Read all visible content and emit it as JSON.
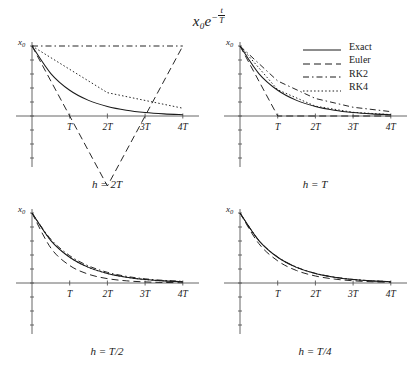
{
  "title": {
    "base": "x",
    "sub": "0",
    "exp_base": "e",
    "exp_num": "t",
    "exp_den": "T",
    "full": "x0 e^(-t/T)"
  },
  "legend": {
    "position": "top-right",
    "entries": [
      {
        "label": "Exact",
        "style": "solid",
        "dash": "none",
        "color": "#1a1a1a"
      },
      {
        "label": "Euler",
        "style": "dashed",
        "dash": "7,4",
        "color": "#1a1a1a"
      },
      {
        "label": "RK2",
        "style": "dashdot",
        "dash": "6,3,1.5,3",
        "color": "#1a1a1a"
      },
      {
        "label": "RK4",
        "style": "dotted",
        "dash": "1.5,2.2",
        "color": "#1a1a1a"
      }
    ]
  },
  "axes": {
    "xlabel": "",
    "ylabel": "x0",
    "ytop_label": "x",
    "ytop_sub": "0",
    "xticks": [
      {
        "t": 1,
        "label": "T"
      },
      {
        "t": 2,
        "label": "2T"
      },
      {
        "t": 3,
        "label": "3T"
      },
      {
        "t": 4,
        "label": "4T"
      }
    ],
    "xlim": [
      0,
      4.35
    ],
    "grid": false
  },
  "chart_data": {
    "type": "line",
    "xlabel": "t",
    "ylabel": "x",
    "x": [
      0,
      1,
      2,
      3,
      4
    ],
    "xlim": [
      0,
      4.35
    ],
    "ylim": [
      -1.15,
      1.05
    ],
    "legend": [
      "Exact",
      "Euler",
      "RK2",
      "RK4"
    ],
    "panels": [
      {
        "caption": "h = 2T",
        "h": 2,
        "ylim": [
          -1.15,
          1.05
        ],
        "series": [
          {
            "name": "Exact",
            "x": [
              0,
              0.5,
              1,
              1.5,
              2,
              2.5,
              3,
              3.5,
              4
            ],
            "values": [
              1,
              0.6065,
              0.3679,
              0.2231,
              0.1353,
              0.0821,
              0.0498,
              0.0302,
              0.0183
            ]
          },
          {
            "name": "Euler",
            "x": [
              0,
              2,
              4
            ],
            "values": [
              1,
              -1,
              1
            ]
          },
          {
            "name": "RK2",
            "x": [
              0,
              2,
              4
            ],
            "values": [
              1,
              1,
              1
            ]
          },
          {
            "name": "RK4",
            "x": [
              0,
              2,
              4
            ],
            "values": [
              1,
              0.3333,
              0.1111
            ]
          }
        ]
      },
      {
        "caption": "h = T",
        "h": 1,
        "ylim": [
          -1.15,
          1.05
        ],
        "series": [
          {
            "name": "Exact",
            "x": [
              0,
              0.5,
              1,
              1.5,
              2,
              2.5,
              3,
              3.5,
              4
            ],
            "values": [
              1,
              0.6065,
              0.3679,
              0.2231,
              0.1353,
              0.0821,
              0.0498,
              0.0302,
              0.0183
            ]
          },
          {
            "name": "Euler",
            "x": [
              0,
              1,
              2,
              3,
              4
            ],
            "values": [
              1,
              0,
              0,
              0,
              0
            ]
          },
          {
            "name": "RK2",
            "x": [
              0,
              1,
              2,
              3,
              4
            ],
            "values": [
              1,
              0.5,
              0.25,
              0.125,
              0.0625
            ]
          },
          {
            "name": "RK4",
            "x": [
              0,
              1,
              2,
              3,
              4
            ],
            "values": [
              1,
              0.375,
              0.1406,
              0.0527,
              0.0198
            ]
          }
        ]
      },
      {
        "caption": "h = T/2",
        "h": 0.5,
        "ylim": [
          -1.15,
          1.05
        ],
        "series": [
          {
            "name": "Exact",
            "x": [
              0,
              0.5,
              1,
              1.5,
              2,
              2.5,
              3,
              3.5,
              4
            ],
            "values": [
              1,
              0.6065,
              0.3679,
              0.2231,
              0.1353,
              0.0821,
              0.0498,
              0.0302,
              0.0183
            ]
          },
          {
            "name": "Euler",
            "x": [
              0,
              0.5,
              1,
              1.5,
              2,
              2.5,
              3,
              3.5,
              4
            ],
            "values": [
              1,
              0.5,
              0.25,
              0.125,
              0.0625,
              0.0313,
              0.0156,
              0.0078,
              0.0039
            ]
          },
          {
            "name": "RK2",
            "x": [
              0,
              0.5,
              1,
              1.5,
              2,
              2.5,
              3,
              3.5,
              4
            ],
            "values": [
              1,
              0.625,
              0.3906,
              0.2441,
              0.1526,
              0.0954,
              0.0596,
              0.0373,
              0.0233
            ]
          },
          {
            "name": "RK4",
            "x": [
              0,
              0.5,
              1,
              1.5,
              2,
              2.5,
              3,
              3.5,
              4
            ],
            "values": [
              1,
              0.6068,
              0.3682,
              0.2234,
              0.1356,
              0.0823,
              0.0499,
              0.0303,
              0.0184
            ]
          }
        ]
      },
      {
        "caption": "h = T/4",
        "h": 0.25,
        "ylim": [
          -1.15,
          1.05
        ],
        "series": [
          {
            "name": "Exact",
            "x": [
              0,
              0.5,
              1,
              1.5,
              2,
              2.5,
              3,
              3.5,
              4
            ],
            "values": [
              1,
              0.6065,
              0.3679,
              0.2231,
              0.1353,
              0.0821,
              0.0498,
              0.0302,
              0.0183
            ]
          },
          {
            "name": "Euler",
            "x": [
              0,
              0.5,
              1,
              1.5,
              2,
              2.5,
              3,
              3.5,
              4
            ],
            "values": [
              1,
              0.5625,
              0.3164,
              0.178,
              0.1001,
              0.0563,
              0.0317,
              0.0178,
              0.01
            ]
          },
          {
            "name": "RK2",
            "x": [
              0,
              0.5,
              1,
              1.5,
              2,
              2.5,
              3,
              3.5,
              4
            ],
            "values": [
              1,
              0.6095,
              0.3715,
              0.2264,
              0.138,
              0.0841,
              0.0513,
              0.0312,
              0.019
            ]
          },
          {
            "name": "RK4",
            "x": [
              0,
              0.5,
              1,
              1.5,
              2,
              2.5,
              3,
              3.5,
              4
            ],
            "values": [
              1,
              0.6065,
              0.3679,
              0.2231,
              0.1353,
              0.0821,
              0.0498,
              0.0302,
              0.0183
            ]
          }
        ]
      }
    ]
  }
}
